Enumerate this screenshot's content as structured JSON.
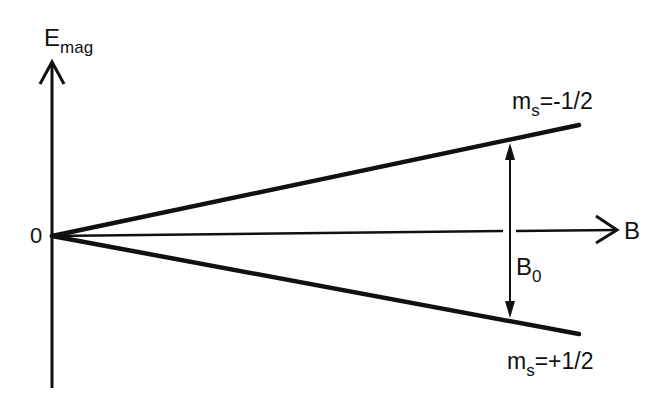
{
  "diagram": {
    "type": "zeeman-splitting-energy-diagram",
    "y_axis": {
      "label_main": "E",
      "label_sub": "mag"
    },
    "x_axis": {
      "label": "B"
    },
    "origin_label": "0",
    "upper_level": {
      "label_main": "m",
      "label_sub": "s",
      "label_value": "=-1/2"
    },
    "lower_level": {
      "label_main": "m",
      "label_sub": "s",
      "label_value": "=+1/2"
    },
    "gap_label": {
      "label_main": "B",
      "label_sub": "0"
    },
    "colors": {
      "line": "#111111",
      "background": "#ffffff"
    }
  }
}
